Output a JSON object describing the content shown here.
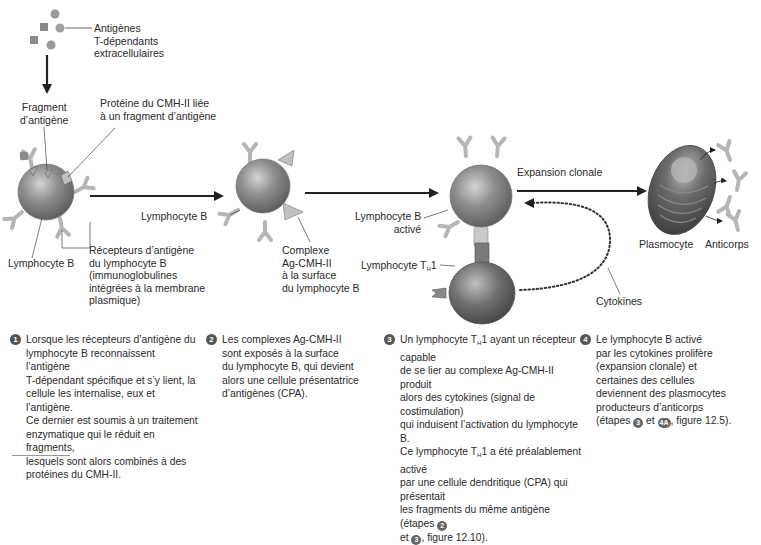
{
  "labels": {
    "antigens": "Antigènes\nT-dépendants\nextracellulaires",
    "antigen_fragment": "Fragment\nd’antigène",
    "mhc_protein": "Protéine du CMH-II liée\nà un fragment d’antigène",
    "lymphocyte_b_1": "Lymphocyte B",
    "receptors": "Récepteurs d’antigène\ndu lymphocyte B\n(immunoglobulines\nintégrées à la membrane\nplasmique)",
    "lymphocyte_b_2": "Lymphocyte B",
    "complex": "Complexe\nAg-CMH-II\nà la surface\ndu lymphocyte B",
    "lymphocyte_b_activated": "Lymphocyte B\nactivé",
    "lymphocyte_th1_prefix": "Lymphocyte T",
    "lymphocyte_th1_sub": "H",
    "lymphocyte_th1_suffix": "1",
    "clonal_expansion": "Expansion clonale",
    "cytokines": "Cytokines",
    "plasmocyte": "Plasmocyte",
    "antibodies": "Anticorps"
  },
  "steps": [
    {
      "number": "1",
      "text": "Lorsque les récepteurs d’antigène du\nlymphocyte B reconnaissent l’antigène\nT-dépendant spécifique et s’y lient, la\ncellule les internalise, eux et l’antigène.\nCe dernier est soumis à un traitement\nenzymatique qui le réduit en fragments,\nlesquels sont alors combinés à des\nprotéines du CMH-II."
    },
    {
      "number": "2",
      "text": "Les complexes Ag-CMH-II\nsont exposés à la surface\ndu lymphocyte B, qui devient\nalors une cellule présentatrice\nd’antigènes (CPA)."
    },
    {
      "number": "3",
      "line1_prefix": "Un lymphocyte T",
      "line1_sub": "H",
      "line1_suffix": "1 ayant un récepteur capable",
      "text_mid": "de se lier au complexe Ag-CMH-II produit\nalors des cytokines (signal de costimulation)\nqui induisent l’activation du lymphocyte B.",
      "line5_prefix": "Ce lymphocyte T",
      "line5_sub": "H",
      "line5_suffix": "1 a été préalablement activé",
      "text_end": "par une cellule dendritique (CPA) qui présentait\nles fragments du même antigène (étapes",
      "ref_a": "2",
      "ref_join": "et",
      "ref_b": "3",
      "ref_tail": ", figure 12.10)."
    },
    {
      "number": "4",
      "text": "Le lymphocyte B activé\npar les cytokines prolifère\n(expansion clonale) et\ncertaines des cellules\ndeviennent des plasmocytes\nproducteurs d’anticorps",
      "ref_prefix": "(étapes",
      "ref_a": "3",
      "ref_join": "et",
      "ref_b": "4A",
      "ref_tail": ", figure 12.5)."
    }
  ],
  "colors": {
    "cell_body": "#8a8a8a",
    "cell_highlight": "#c8c8c8",
    "receptor": "#b0b0b0",
    "arrow": "#222222",
    "text": "#2a2a2a"
  }
}
